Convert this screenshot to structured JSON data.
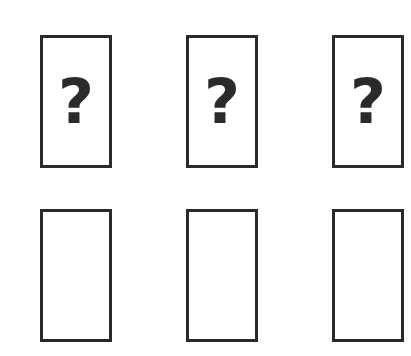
{
  "top_row": [
    {
      "label": "?"
    },
    {
      "label": "?"
    },
    {
      "label": "?"
    }
  ],
  "bottom_row": [
    {
      "label": ""
    },
    {
      "label": ""
    },
    {
      "label": ""
    }
  ],
  "colors": {
    "stroke": "#2a2a2a",
    "background": "#ffffff"
  }
}
